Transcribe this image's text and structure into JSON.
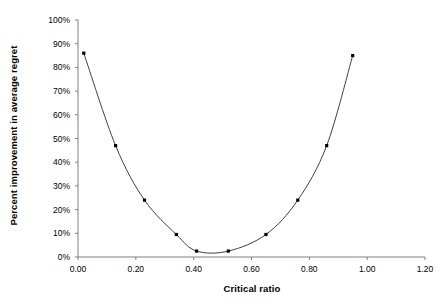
{
  "chart_data": {
    "type": "line",
    "title": "",
    "xlabel": "Critical ratio",
    "ylabel": "Percent improvement in average regret",
    "xlim": [
      0.0,
      1.2
    ],
    "ylim": [
      0.0,
      1.0
    ],
    "grid": false,
    "legend": "none",
    "marker": "filled-square",
    "line_color": "#000000",
    "marker_color": "#000000",
    "xticks": [
      "0.00",
      "0.20",
      "0.40",
      "0.60",
      "0.80",
      "1.00",
      "1.20"
    ],
    "xtick_values": [
      0.0,
      0.2,
      0.4,
      0.6,
      0.8,
      1.0,
      1.2
    ],
    "yticks": [
      "0%",
      "10%",
      "20%",
      "30%",
      "40%",
      "50%",
      "60%",
      "70%",
      "80%",
      "90%",
      "100%"
    ],
    "ytick_values": [
      0,
      10,
      20,
      30,
      40,
      50,
      60,
      70,
      80,
      90,
      100
    ],
    "series": [
      {
        "name": "Percent improvement in average regret",
        "x": [
          0.02,
          0.13,
          0.23,
          0.34,
          0.41,
          0.52,
          0.65,
          0.76,
          0.86,
          0.95
        ],
        "y": [
          86,
          47,
          24,
          9.5,
          2.5,
          2.5,
          9.5,
          24,
          47,
          85
        ]
      }
    ]
  },
  "axis": {
    "x_title": "Critical ratio",
    "y_title": "Percent improvement in average regret"
  }
}
